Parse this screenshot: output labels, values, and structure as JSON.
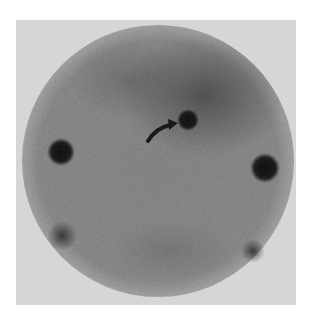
{
  "image": {
    "kind": "scintigraphy-scan",
    "frame_color": "#d6d6d6",
    "field_color": "#8a8a8a",
    "field": {
      "cx": 158,
      "cy": 161,
      "r": 136
    },
    "diffuse_region": {
      "cx": 205,
      "cy": 95,
      "rx": 80,
      "ry": 60,
      "color": "#5a5a5a"
    },
    "focal_spot": {
      "cx": 188,
      "cy": 120,
      "r": 9,
      "color": "#262626"
    },
    "markers": [
      {
        "name": "marker-left",
        "cx": 61,
        "cy": 152,
        "r": 11,
        "color": "#1c1c1c"
      },
      {
        "name": "marker-right",
        "cx": 265,
        "cy": 168,
        "r": 12,
        "color": "#151515"
      },
      {
        "name": "marker-lower-left",
        "cx": 62,
        "cy": 236,
        "r": 12,
        "color": "#3e3e3e"
      },
      {
        "name": "marker-lower-right",
        "cx": 253,
        "cy": 251,
        "r": 9,
        "color": "#3a3a3a"
      }
    ],
    "arrow": {
      "type": "curved-arrow",
      "from": [
        148,
        140
      ],
      "to": [
        176,
        123
      ],
      "color": "#1a1a1a"
    }
  }
}
